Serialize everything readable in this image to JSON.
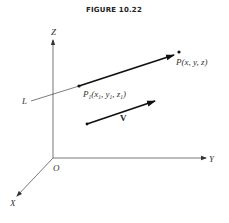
{
  "figure": {
    "title": "FIGURE 10.22",
    "axes": {
      "z_label": "Z",
      "y_label": "Y",
      "x_label": "X",
      "origin_label": "O"
    },
    "line": {
      "label": "L"
    },
    "points": {
      "p1": {
        "name": "P",
        "sub": "1",
        "open": "(",
        "x": "x",
        "x_sub": "1",
        "y": "y",
        "y_sub": "1",
        "z": "z",
        "z_sub": "1",
        "close": ")",
        "sep": ", "
      },
      "p": {
        "text": "P(x, y, z)"
      }
    },
    "vector": {
      "label": "V"
    },
    "colors": {
      "ink": "#222222",
      "axis": "#555555",
      "background": "#ffffff"
    }
  }
}
